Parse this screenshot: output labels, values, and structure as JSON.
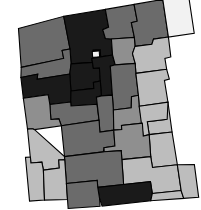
{
  "figure": {
    "type": "choropleth-map",
    "region": "New Mexico",
    "unit": "county",
    "width": 201,
    "height": 210,
    "background_color": "#ffffff",
    "border_color": "#000000",
    "border_width": 1.1,
    "rotation_deg": -4,
    "palette": {
      "level_1": "#f2f2f2",
      "level_2": "#bdbdbd",
      "level_3": "#8f8f8f",
      "level_4": "#6b6b6b",
      "level_5": "#1a1a1a"
    },
    "palette_order": [
      "level_1",
      "level_2",
      "level_3",
      "level_4",
      "level_5"
    ]
  },
  "chart_data": {
    "type": "heatmap",
    "title": "",
    "subtitle": "",
    "xlabel": "",
    "ylabel": "",
    "legend": [],
    "grid": false,
    "categories": [
      "San Juan",
      "Rio Arriba",
      "Taos",
      "Colfax",
      "Union",
      "McKinley",
      "Sandoval",
      "Los Alamos",
      "Santa Fe",
      "Mora",
      "Harding",
      "Cibola",
      "Bernalillo",
      "San Miguel",
      "Quay",
      "Valencia",
      "Torrance",
      "Guadalupe",
      "Curry",
      "De Baca",
      "Roosevelt",
      "Catron",
      "Socorro",
      "Lincoln",
      "Chaves",
      "Grant",
      "Sierra",
      "Otero",
      "Eddy",
      "Lea",
      "Hidalgo",
      "Luna",
      "Dona Ana"
    ],
    "values": [
      4,
      5,
      4,
      4,
      1,
      4,
      5,
      1,
      5,
      3,
      2,
      5,
      5,
      4,
      2,
      4,
      4,
      3,
      2,
      2,
      2,
      3,
      4,
      3,
      2,
      2,
      4,
      5,
      2,
      2,
      2,
      2,
      4
    ],
    "value_label": "shade level",
    "vmin": 1,
    "vmax": 5
  },
  "counties": [
    {
      "name": "San Juan",
      "shade": "level_4",
      "color": "#6b6b6b",
      "points": "24,23 70,14 74,47 66,48 67,56 24,62"
    },
    {
      "name": "Rio Arriba",
      "shade": "level_5",
      "color": "#1a1a1a",
      "points": "70,14 112,10 114,28 108,30 110,39 116,40 116,56 104,57 104,50 97,50 96,62 74,62 74,47"
    },
    {
      "name": "Taos",
      "shade": "level_4",
      "color": "#6b6b6b",
      "points": "112,10 141,7 143,24 137,25 139,40 116,40 110,39 108,30 114,28"
    },
    {
      "name": "Colfax",
      "shade": "level_4",
      "color": "#6b6b6b",
      "points": "141,7 170,4 173,42 158,43 156,48 139,49 139,40 137,25 143,24"
    },
    {
      "name": "Union",
      "shade": "level_1",
      "color": "#f2f2f2",
      "points": "170,4 196,2 199,40 173,42"
    },
    {
      "name": "McKinley",
      "shade": "level_4",
      "color": "#6b6b6b",
      "points": "24,62 67,56 66,48 74,47 74,62 72,72 39,75 40,70 23,72"
    },
    {
      "name": "Sandoval",
      "shade": "level_5",
      "color": "#1a1a1a",
      "points": "74,62 96,62 97,50 104,50 104,57 95,58 96,68 102,68 102,81 95,82 95,88 72,89 72,72"
    },
    {
      "name": "Los Alamos",
      "shade": "level_1",
      "color": "#f2f2f2",
      "points": "96,51 103,51 103,57 96,57"
    },
    {
      "name": "Santa Fe",
      "shade": "level_5",
      "color": "#1a1a1a",
      "points": "104,57 116,56 118,66 113,67 113,96 102,96 102,81 102,68 96,68 95,58"
    },
    {
      "name": "Mora",
      "shade": "level_3",
      "color": "#8f8f8f",
      "points": "116,40 139,40 139,49 136,56 138,66 118,66 116,56"
    },
    {
      "name": "Harding",
      "shade": "level_2",
      "color": "#bdbdbd",
      "points": "139,49 156,48 158,43 173,42 174,62 168,63 169,74 138,76 138,66 136,56"
    },
    {
      "name": "Cibola",
      "shade": "level_5",
      "color": "#1a1a1a",
      "points": "23,72 40,70 39,75 72,72 72,89 71,100 50,101 49,91 24,93"
    },
    {
      "name": "Bernalillo",
      "shade": "level_5",
      "color": "#1a1a1a",
      "points": "72,89 95,88 95,82 102,81 102,96 97,97 97,104 71,104 71,100"
    },
    {
      "name": "San Miguel",
      "shade": "level_4",
      "color": "#6b6b6b",
      "points": "118,66 138,66 138,76 139,98 132,99 131,110 113,111 113,96 113,67"
    },
    {
      "name": "Quay",
      "shade": "level_2",
      "color": "#bdbdbd",
      "points": "138,76 169,74 171,84 166,85 168,107 139,109 139,98"
    },
    {
      "name": "Valencia",
      "shade": "level_4",
      "color": "#6b6b6b",
      "points": "50,101 71,100 71,104 97,104 98,120 60,123 58,116 50,116"
    },
    {
      "name": "Torrance",
      "shade": "level_4",
      "color": "#6b6b6b",
      "points": "97,97 102,96 113,96 113,111 112,131 98,132 98,120"
    },
    {
      "name": "Guadalupe",
      "shade": "level_3",
      "color": "#8f8f8f",
      "points": "113,111 131,110 132,99 139,98 139,109 141,126 120,127 120,131 112,131"
    },
    {
      "name": "Curry",
      "shade": "level_2",
      "color": "#bdbdbd",
      "points": "166,107 168,107 170,137 147,138 146,125 164,124"
    },
    {
      "name": "De Baca",
      "shade": "level_2",
      "color": "#bdbdbd",
      "points": "139,109 168,107 166,124 146,125 147,138 141,139 140,126"
    },
    {
      "name": "Roosevelt",
      "shade": "level_2",
      "color": "#bdbdbd",
      "points": "147,138 170,137 173,170 148,171 147,160"
    },
    {
      "name": "Catron",
      "shade": "level_3",
      "color": "#8f8f8f",
      "points": "24,93 49,91 50,101 50,116 58,116 60,123 33,125 31,124 26,124"
    },
    {
      "name": "Socorro",
      "shade": "level_4",
      "color": "#6b6b6b",
      "points": "60,123 98,120 98,132 112,131 112,147 101,148 100,152 61,154"
    },
    {
      "name": "Lincoln",
      "shade": "level_3",
      "color": "#8f8f8f",
      "points": "112,131 120,131 120,127 141,126 141,139 147,138 147,160 118,161 118,152 101,152 101,148 112,147"
    },
    {
      "name": "Chaves",
      "shade": "level_2",
      "color": "#bdbdbd",
      "points": "147,160 148,171 173,170 175,196 146,197 145,185 118,186 118,161"
    },
    {
      "name": "Grant",
      "shade": "level_2",
      "color": "#bdbdbd",
      "points": "26,124 31,124 33,125 61,154 61,157 55,157 55,165 39,166 38,158 27,158"
    },
    {
      "name": "Sierra",
      "shade": "level_4",
      "color": "#6b6b6b",
      "points": "61,154 100,152 101,152 118,152 118,161 118,186 92,187 92,180 61,181"
    },
    {
      "name": "Otero",
      "shade": "level_5",
      "color": "#1a1a1a",
      "points": "92,187 118,186 145,185 146,197 144,204 95,206 93,198"
    },
    {
      "name": "Eddy",
      "shade": "level_2",
      "color": "#bdbdbd",
      "points": "146,197 175,196 177,204 144,204"
    },
    {
      "name": "Lea",
      "shade": "level_2",
      "color": "#bdbdbd",
      "points": "173,170 175,196 177,204 192,204 190,171"
    },
    {
      "name": "Hidalgo",
      "shade": "level_2",
      "color": "#bdbdbd",
      "points": "22,152 27,152 27,158 38,158 39,166 38,196 23,196"
    },
    {
      "name": "Luna",
      "shade": "level_2",
      "color": "#bdbdbd",
      "points": "39,166 55,165 55,157 61,157 61,181 61,197 38,196"
    },
    {
      "name": "Dona Ana",
      "shade": "level_4",
      "color": "#6b6b6b",
      "points": "61,181 92,180 92,187 93,198 93,206 61,206 61,197"
    }
  ]
}
